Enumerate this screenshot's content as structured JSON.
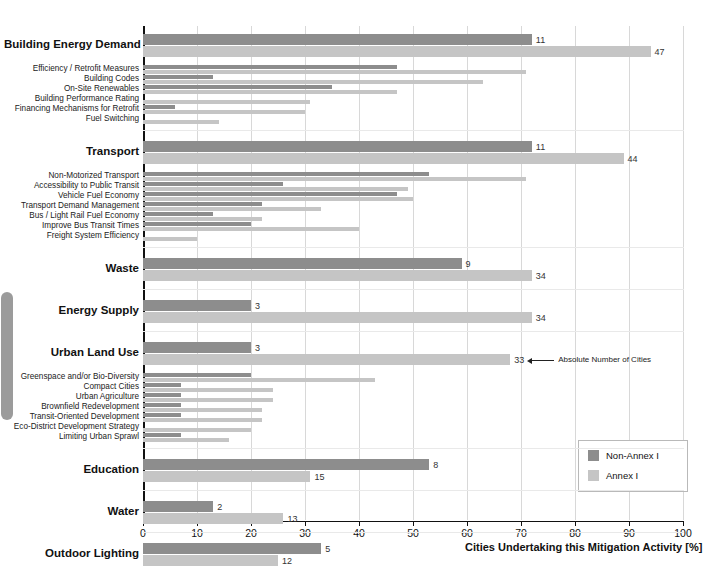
{
  "chart_data": {
    "type": "bar",
    "orientation": "horizontal",
    "title": "",
    "xlabel": "Cities Undertaking this Mitigation Activity [%]",
    "ylabel": "",
    "xlim": [
      0,
      100
    ],
    "xticks": [
      0,
      10,
      20,
      30,
      40,
      50,
      60,
      70,
      80,
      90,
      100
    ],
    "grid": true,
    "legend": {
      "position": "bottom-right",
      "entries": [
        {
          "name": "Non-Annex I",
          "color": "#8d8d8d"
        },
        {
          "name": "Annex I",
          "color": "#c5c5c5"
        }
      ]
    },
    "annotations": [
      {
        "text": "Absolute Number of Cities",
        "target": "urban-land-use-annex-i-count"
      }
    ],
    "value_label_note": "Numbers printed at the end of major-category bars are absolute numbers of cities.",
    "groups": [
      {
        "name": "Building Energy Demand",
        "non_annex_i": 72,
        "annex_i": 94,
        "non_annex_i_count": "11",
        "annex_i_count": "47",
        "subcategories": [
          {
            "name": "Efficiency / Retrofit Measures",
            "non_annex_i": 47,
            "annex_i": 71
          },
          {
            "name": "Building Codes",
            "non_annex_i": 13,
            "annex_i": 63
          },
          {
            "name": "On-Site Renewables",
            "non_annex_i": 35,
            "annex_i": 47
          },
          {
            "name": "Building Performance Rating",
            "non_annex_i": 0,
            "annex_i": 31
          },
          {
            "name": "Financing Mechanisms for Retrofit",
            "non_annex_i": 6,
            "annex_i": 30
          },
          {
            "name": "Fuel Switching",
            "non_annex_i": 0,
            "annex_i": 14
          }
        ]
      },
      {
        "name": "Transport",
        "non_annex_i": 72,
        "annex_i": 89,
        "non_annex_i_count": "11",
        "annex_i_count": "44",
        "subcategories": [
          {
            "name": "Non-Motorized Transport",
            "non_annex_i": 53,
            "annex_i": 71
          },
          {
            "name": "Accessibility to Public Transit",
            "non_annex_i": 26,
            "annex_i": 49
          },
          {
            "name": "Vehicle Fuel Economy",
            "non_annex_i": 47,
            "annex_i": 50
          },
          {
            "name": "Transport Demand Management",
            "non_annex_i": 22,
            "annex_i": 33
          },
          {
            "name": "Bus / Light Rail Fuel Economy",
            "non_annex_i": 13,
            "annex_i": 22
          },
          {
            "name": "Improve Bus Transit Times",
            "non_annex_i": 20,
            "annex_i": 40
          },
          {
            "name": "Freight System Efficiency",
            "non_annex_i": 0,
            "annex_i": 10
          }
        ]
      },
      {
        "name": "Waste",
        "non_annex_i": 59,
        "annex_i": 72,
        "non_annex_i_count": "9",
        "annex_i_count": "34",
        "subcategories": []
      },
      {
        "name": "Energy Supply",
        "non_annex_i": 20,
        "annex_i": 72,
        "non_annex_i_count": "3",
        "annex_i_count": "34",
        "subcategories": []
      },
      {
        "name": "Urban Land Use",
        "non_annex_i": 20,
        "annex_i": 68,
        "non_annex_i_count": "3",
        "annex_i_count": "33",
        "subcategories": [
          {
            "name": "Greenspace and/or Bio-Diversity",
            "non_annex_i": 20,
            "annex_i": 43
          },
          {
            "name": "Compact Cities",
            "non_annex_i": 7,
            "annex_i": 24
          },
          {
            "name": "Urban Agriculture",
            "non_annex_i": 7,
            "annex_i": 24
          },
          {
            "name": "Brownfield Redevelopment",
            "non_annex_i": 7,
            "annex_i": 22
          },
          {
            "name": "Transit-Oriented Development",
            "non_annex_i": 7,
            "annex_i": 22
          },
          {
            "name": "Eco-District Development Strategy",
            "non_annex_i": 0,
            "annex_i": 20
          },
          {
            "name": "Limiting Urban Sprawl",
            "non_annex_i": 7,
            "annex_i": 16
          }
        ]
      },
      {
        "name": "Education",
        "non_annex_i": 53,
        "annex_i": 31,
        "non_annex_i_count": "8",
        "annex_i_count": "15",
        "subcategories": []
      },
      {
        "name": "Water",
        "non_annex_i": 13,
        "annex_i": 26,
        "non_annex_i_count": "2",
        "annex_i_count": "13",
        "subcategories": []
      },
      {
        "name": "Outdoor Lighting",
        "non_annex_i": 33,
        "annex_i": 25,
        "non_annex_i_count": "5",
        "annex_i_count": "12",
        "subcategories": []
      }
    ]
  }
}
